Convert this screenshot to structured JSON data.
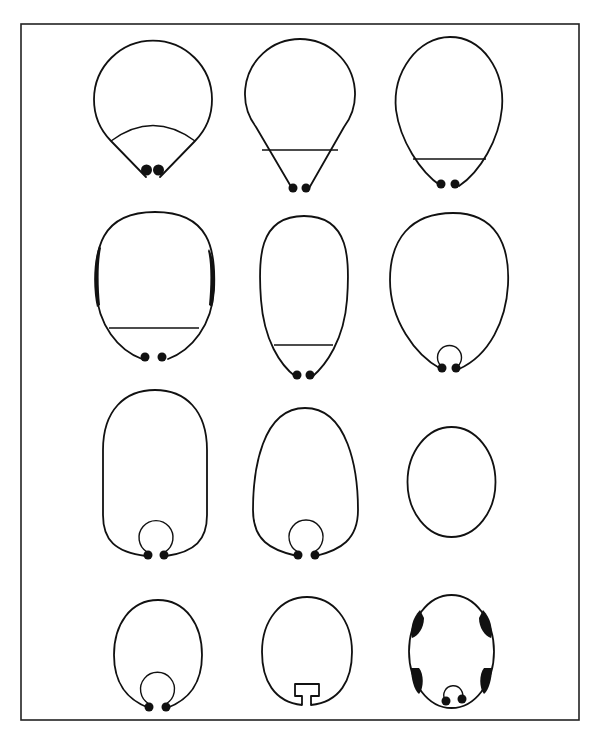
{
  "figure": {
    "title": "",
    "frame": {
      "x": 21,
      "y": 24,
      "width": 558,
      "height": 696
    },
    "stroke_color": "#111111",
    "layout": {
      "rows": 4,
      "cols": 3
    },
    "panels": [
      {
        "id": 1,
        "row": 1,
        "col": 1,
        "form": "round body with conical base, curved arc partition, two basal dots"
      },
      {
        "id": 2,
        "row": 1,
        "col": 2,
        "form": "round body with conical base, straight partition, two basal dots"
      },
      {
        "id": 3,
        "row": 1,
        "col": 3,
        "form": "ovoid body tapering to base, straight partition, two basal dots"
      },
      {
        "id": 4,
        "row": 2,
        "col": 1,
        "form": "oval body with thickened lateral walls, straight partition, two basal dots"
      },
      {
        "id": 5,
        "row": 2,
        "col": 2,
        "form": "elongate club-shaped body, straight partition, two basal dots"
      },
      {
        "id": 6,
        "row": 2,
        "col": 3,
        "form": "ovoid body with small basal loop, two basal dots"
      },
      {
        "id": 7,
        "row": 3,
        "col": 1,
        "form": "elongate capsule body with basal loop, two basal dots"
      },
      {
        "id": 8,
        "row": 3,
        "col": 2,
        "form": "pear-shaped body with basal loop, two basal dots"
      },
      {
        "id": 9,
        "row": 3,
        "col": 3,
        "form": "simple ellipse"
      },
      {
        "id": 10,
        "row": 4,
        "col": 1,
        "form": "oval body with basal loop, two basal dots"
      },
      {
        "id": 11,
        "row": 4,
        "col": 2,
        "form": "oval body with T-shaped basal notch"
      },
      {
        "id": 12,
        "row": 4,
        "col": 3,
        "form": "oval body with four lateral thickenings, basal loop, two basal dots"
      }
    ]
  }
}
